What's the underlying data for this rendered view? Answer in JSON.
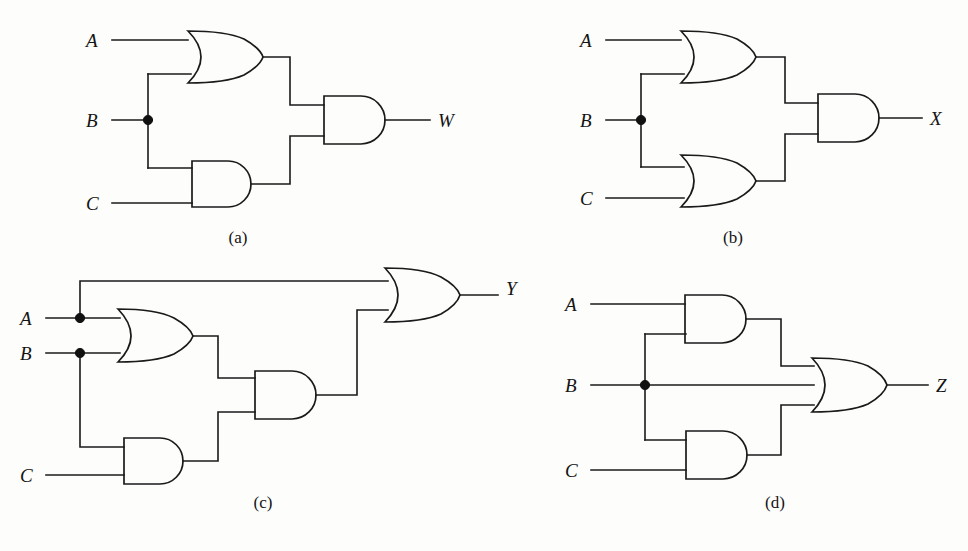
{
  "figure": {
    "type": "logic-circuit-diagram",
    "background_color": "#fdfdfc",
    "line_color": "#1a1a1a",
    "panel_count": 4
  },
  "panels": [
    {
      "id": "a",
      "caption": "(a)",
      "inputs": [
        "A",
        "B",
        "C"
      ],
      "output": "W",
      "gates": [
        {
          "name": "or-gate-ab",
          "type": "OR",
          "inputs": [
            "A",
            "B"
          ]
        },
        {
          "name": "and-gate-bc",
          "type": "AND",
          "inputs": [
            "B",
            "C"
          ]
        },
        {
          "name": "and-gate-out",
          "type": "AND",
          "inputs": [
            "or-gate-ab",
            "and-gate-bc"
          ]
        }
      ],
      "expression": "W = (A + B) · (B · C)",
      "fanout_nodes": [
        "B"
      ]
    },
    {
      "id": "b",
      "caption": "(b)",
      "inputs": [
        "A",
        "B",
        "C"
      ],
      "output": "X",
      "gates": [
        {
          "name": "or-gate-ab",
          "type": "OR",
          "inputs": [
            "A",
            "B"
          ]
        },
        {
          "name": "or-gate-bc",
          "type": "OR",
          "inputs": [
            "B",
            "C"
          ]
        },
        {
          "name": "and-gate-out",
          "type": "AND",
          "inputs": [
            "or-gate-ab",
            "or-gate-bc"
          ]
        }
      ],
      "expression": "X = (A + B) · (B + C)",
      "fanout_nodes": [
        "B"
      ]
    },
    {
      "id": "c",
      "caption": "(c)",
      "inputs": [
        "A",
        "B",
        "C"
      ],
      "output": "Y",
      "gates": [
        {
          "name": "or-gate-ab",
          "type": "OR",
          "inputs": [
            "A",
            "B"
          ]
        },
        {
          "name": "and-gate-bc",
          "type": "AND",
          "inputs": [
            "B",
            "C"
          ]
        },
        {
          "name": "and-gate-mid",
          "type": "AND",
          "inputs": [
            "or-gate-ab",
            "and-gate-bc"
          ]
        },
        {
          "name": "or-gate-out",
          "type": "OR",
          "inputs": [
            "A",
            "and-gate-mid"
          ]
        }
      ],
      "expression": "Y = A + ((A + B) · (B · C))",
      "fanout_nodes": [
        "A",
        "B"
      ]
    },
    {
      "id": "d",
      "caption": "(d)",
      "inputs": [
        "A",
        "B",
        "C"
      ],
      "output": "Z",
      "gates": [
        {
          "name": "and-gate-ab",
          "type": "AND",
          "inputs": [
            "A",
            "B"
          ]
        },
        {
          "name": "and-gate-bc",
          "type": "AND",
          "inputs": [
            "B",
            "C"
          ]
        },
        {
          "name": "or-gate-out",
          "type": "OR",
          "inputs": [
            "and-gate-ab",
            "B",
            "and-gate-bc"
          ]
        }
      ],
      "expression": "Z = (A · B) + B + (B · C)",
      "fanout_nodes": [
        "B"
      ]
    }
  ],
  "labels": {
    "a": {
      "in_a": "A",
      "in_b": "B",
      "in_c": "C",
      "out": "W",
      "caption": "(a)"
    },
    "b": {
      "in_a": "A",
      "in_b": "B",
      "in_c": "C",
      "out": "X",
      "caption": "(b)"
    },
    "c": {
      "in_a": "A",
      "in_b": "B",
      "in_c": "C",
      "out": "Y",
      "caption": "(c)"
    },
    "d": {
      "in_a": "A",
      "in_b": "B",
      "in_c": "C",
      "out": "Z",
      "caption": "(d)"
    }
  }
}
